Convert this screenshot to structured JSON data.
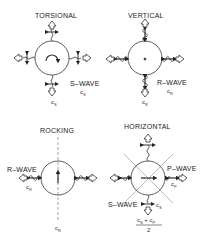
{
  "panels": {
    "torsional": {
      "title": "TORSIONAL",
      "wave_label": "S–WAVE",
      "wave_speed_right": "c",
      "wave_speed_right_sub": "S",
      "wave_speed_bottom": "c",
      "wave_speed_bottom_sub": "S",
      "center_symbol": "rotation-arc"
    },
    "vertical": {
      "title": "VERTICAL",
      "wave_label": "R–WAVE",
      "wave_speed_right": "c",
      "wave_speed_right_sub": "R",
      "wave_speed_bottom": "c",
      "wave_speed_bottom_sub": "R",
      "center_symbol": "dot"
    },
    "rocking": {
      "title": "ROCKING",
      "wave_label": "R–WAVE",
      "wave_speed_left": "c",
      "wave_speed_left_sub": "R",
      "wave_speed_bottom": "c",
      "wave_speed_bottom_sub": "R",
      "center_symbol": "vertical-arrow"
    },
    "horizontal": {
      "title": "HORIZONTAL",
      "wave_label_right": "P–WAVE",
      "wave_speed_right": "c",
      "wave_speed_right_sub": "P",
      "wave_label_left": "S–WAVE",
      "wave_speed_bottom": "c",
      "wave_speed_bottom_sub": "S",
      "fraction_numerator": "c",
      "fraction_num_sub1": "S",
      "fraction_plus": " + c",
      "fraction_num_sub2": "P",
      "fraction_denominator": "2",
      "center_symbol": "horizontal-arrow"
    }
  },
  "colors": {
    "line": "#333333",
    "dashed": "#666666",
    "arrow_fill": "#ffffff"
  }
}
